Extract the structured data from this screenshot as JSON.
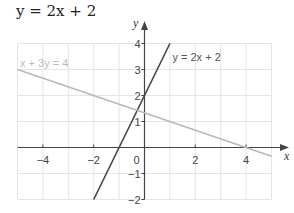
{
  "title": "y = 2x + 2",
  "chart_data": {
    "type": "line",
    "title": "y = 2x + 2",
    "xlabel": "x",
    "ylabel": "y",
    "xlim": [
      -5,
      5
    ],
    "ylim": [
      -2,
      4
    ],
    "grid": true,
    "x_ticks": [
      -4,
      -2,
      0,
      2,
      4
    ],
    "x_tick_labels": [
      "−4",
      "−2",
      "0",
      "2",
      "4"
    ],
    "y_ticks": [
      -2,
      -1,
      1,
      2,
      3,
      4
    ],
    "y_tick_labels": [
      "−2",
      "−1",
      "1",
      "2",
      "3",
      "4"
    ],
    "series": [
      {
        "name": "y = 2x + 2",
        "label": "y = 2x + 2",
        "color": "#444444",
        "points": [
          [
            -2,
            -2
          ],
          [
            1,
            4
          ]
        ]
      },
      {
        "name": "x + 3y = 4",
        "label": "x + 3y = 4",
        "color": "#b8b8b8",
        "points": [
          [
            -5,
            3
          ],
          [
            5,
            -0.3333
          ]
        ]
      }
    ],
    "annotations": [
      {
        "text": "y = 2x + 2",
        "x": 1.1,
        "y": 3.5
      },
      {
        "text": "x + 3y = 4",
        "x": -4.9,
        "y": 3.25
      }
    ]
  },
  "colors": {
    "grid": "#e4e4e4",
    "axis": "#444444",
    "tick_text": "#444444"
  }
}
